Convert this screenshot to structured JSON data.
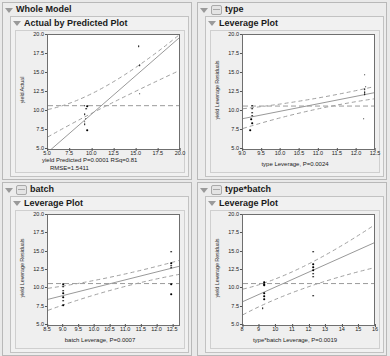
{
  "panels": [
    {
      "id": "whole-model",
      "title": "Whole Model",
      "has_badge": false,
      "subtitle": "Actual by Predicted Plot",
      "chart_data": {
        "type": "scatter",
        "title": "Actual by Predicted Plot",
        "xlabel": "yield Predicted P=0.0001 RSq=0.81",
        "xlabel2": "RMSE=1.5411",
        "ylabel": "yield Actual",
        "xlim": [
          5.0,
          20.0
        ],
        "ylim": [
          5.0,
          20.0
        ],
        "xticks": [
          "5.0",
          "7.5",
          "10.0",
          "12.5",
          "15.0",
          "17.5",
          "20.0"
        ],
        "yticks": [
          "20.0",
          "17.5",
          "15.0",
          "12.5",
          "10.0",
          "7.5",
          "5.0"
        ],
        "points": [
          [
            9.2,
            10.7
          ],
          [
            9.5,
            10.6
          ],
          [
            9.4,
            10.3
          ],
          [
            9.2,
            9.6
          ],
          [
            9.3,
            9.0
          ],
          [
            9.2,
            8.6
          ],
          [
            9.2,
            8.3
          ],
          [
            9.5,
            7.5
          ],
          [
            15.4,
            18.5
          ],
          [
            15.5,
            16.0
          ],
          [
            15.5,
            12.3
          ]
        ],
        "fit_line": [
          [
            5.0,
            4.6
          ],
          [
            20.0,
            19.6
          ]
        ],
        "mean_line_y": 10.7,
        "ci_upper": [
          [
            5.0,
            10.2
          ],
          [
            11.0,
            11.6
          ],
          [
            20.0,
            20.0
          ]
        ],
        "ci_lower": [
          [
            5.0,
            6.6
          ],
          [
            11.0,
            10.5
          ],
          [
            20.0,
            15.3
          ]
        ]
      }
    },
    {
      "id": "type",
      "title": "type",
      "has_badge": true,
      "subtitle": "Leverage Plot",
      "chart_data": {
        "type": "scatter",
        "title": "Leverage Plot",
        "xlabel": "type Leverage, P=0.0024",
        "xlabel2": "",
        "ylabel": "yield Leverage Residuals",
        "xlim": [
          9.0,
          12.5
        ],
        "ylim": [
          5.0,
          20.0
        ],
        "xticks": [
          "9.0",
          "9.5",
          "10.0",
          "10.5",
          "11.0",
          "11.5",
          "12.0",
          "12.5"
        ],
        "yticks": [
          "20.0",
          "17.5",
          "15.0",
          "12.5",
          "10.0",
          "7.5",
          "5.0"
        ],
        "points": [
          [
            9.25,
            10.7
          ],
          [
            9.25,
            10.3
          ],
          [
            9.25,
            9.8
          ],
          [
            9.25,
            9.4
          ],
          [
            9.22,
            8.9
          ],
          [
            9.25,
            8.4
          ],
          [
            9.2,
            7.5
          ],
          [
            12.25,
            14.8
          ],
          [
            12.28,
            13.2
          ],
          [
            12.25,
            12.9
          ],
          [
            12.25,
            12.5
          ],
          [
            12.25,
            12.2
          ],
          [
            12.22,
            9.0
          ]
        ],
        "fit_line": [
          [
            9.0,
            9.0
          ],
          [
            12.5,
            12.4
          ]
        ],
        "mean_line_y": 10.65,
        "ci_upper": [
          [
            9.0,
            10.3
          ],
          [
            10.7,
            11.2
          ],
          [
            12.5,
            13.2
          ]
        ],
        "ci_lower": [
          [
            9.0,
            7.7
          ],
          [
            10.7,
            10.3
          ],
          [
            12.5,
            11.6
          ]
        ]
      }
    },
    {
      "id": "batch",
      "title": "batch",
      "has_badge": true,
      "subtitle": "Leverage Plot",
      "chart_data": {
        "type": "scatter",
        "title": "Leverage Plot",
        "xlabel": "batch  Leverage, P=0.0007",
        "xlabel2": "",
        "ylabel": "yield Leverage Residuals",
        "xlim": [
          8.5,
          12.75
        ],
        "ylim": [
          5.0,
          20.0
        ],
        "xticks": [
          "8.5",
          "9.0",
          "9.5",
          "10.0",
          "10.5",
          "11.0",
          "11.5",
          "12.0",
          "12.5"
        ],
        "yticks": [
          "20.0",
          "17.5",
          "15.0",
          "12.5",
          "10.0",
          "7.5",
          "5.0"
        ],
        "points": [
          [
            9.0,
            10.6
          ],
          [
            9.0,
            10.2
          ],
          [
            9.0,
            9.7
          ],
          [
            9.0,
            9.3
          ],
          [
            9.0,
            8.8
          ],
          [
            9.0,
            8.3
          ],
          [
            9.0,
            7.7
          ],
          [
            12.5,
            15.0
          ],
          [
            12.5,
            13.4
          ],
          [
            12.5,
            13.1
          ],
          [
            12.5,
            12.8
          ],
          [
            12.5,
            10.6
          ],
          [
            12.5,
            9.2
          ]
        ],
        "fit_line": [
          [
            8.5,
            8.5
          ],
          [
            12.75,
            13.0
          ]
        ],
        "mean_line_y": 10.65,
        "ci_upper": [
          [
            8.5,
            10.0
          ],
          [
            10.6,
            11.3
          ],
          [
            12.75,
            13.8
          ]
        ],
        "ci_lower": [
          [
            8.5,
            7.0
          ],
          [
            10.6,
            10.2
          ],
          [
            12.75,
            11.9
          ]
        ]
      }
    },
    {
      "id": "type-batch",
      "title": "type*batch",
      "has_badge": true,
      "subtitle": "Leverage Plot",
      "chart_data": {
        "type": "scatter",
        "title": "Leverage Plot",
        "xlabel": "type*batch  Leverage, P=0.0019",
        "xlabel2": "",
        "ylabel": "yield Leverage Residuals",
        "xlim": [
          8,
          16
        ],
        "ylim": [
          5.0,
          20.0
        ],
        "xticks": [
          "8",
          "9",
          "10",
          "11",
          "12",
          "13",
          "14",
          "15",
          "16"
        ],
        "yticks": [
          "20.0",
          "17.5",
          "15.0",
          "12.5",
          "10.0",
          "7.5",
          "5.0"
        ],
        "points": [
          [
            9.3,
            10.8
          ],
          [
            9.3,
            10.6
          ],
          [
            9.3,
            10.4
          ],
          [
            9.3,
            9.3
          ],
          [
            9.3,
            8.9
          ],
          [
            9.3,
            8.5
          ],
          [
            9.2,
            7.3
          ],
          [
            12.3,
            15.0
          ],
          [
            12.3,
            13.3
          ],
          [
            12.3,
            12.9
          ],
          [
            12.3,
            12.5
          ],
          [
            12.3,
            12.0
          ],
          [
            12.3,
            11.6
          ],
          [
            12.3,
            9.0
          ]
        ],
        "fit_line": [
          [
            8,
            8.2
          ],
          [
            16,
            16.2
          ]
        ],
        "mean_line_y": 10.65,
        "ci_upper": [
          [
            8,
            9.9
          ],
          [
            11.2,
            11.5
          ],
          [
            16,
            18.6
          ]
        ],
        "ci_lower": [
          [
            8,
            6.4
          ],
          [
            11.2,
            10.2
          ],
          [
            16,
            12.8
          ]
        ]
      }
    }
  ]
}
